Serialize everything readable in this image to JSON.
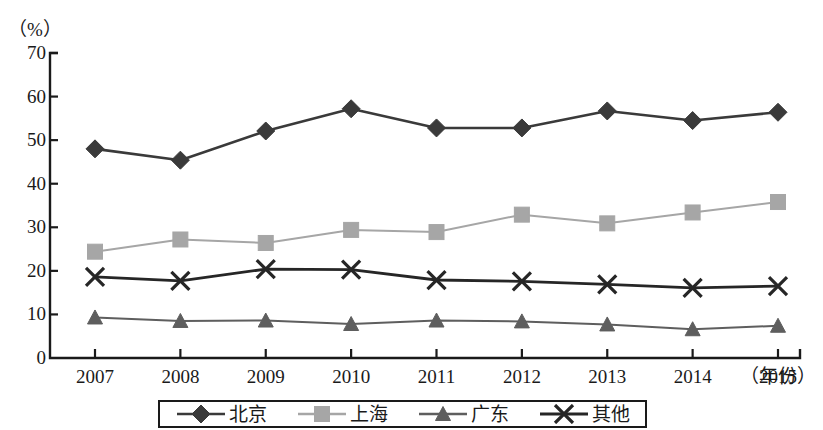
{
  "chart_data": {
    "type": "line",
    "title": "",
    "subtitle": "",
    "xlabel": "（年份）",
    "ylabel": "（%）",
    "ylim": [
      0,
      70
    ],
    "yticks": [
      0,
      10,
      20,
      30,
      40,
      50,
      60,
      70
    ],
    "ytick_labels": [
      "0",
      "10",
      "20",
      "30",
      "40",
      "50",
      "60",
      "70"
    ],
    "grid": false,
    "legend_position": "bottom",
    "categories": [
      "2007",
      "2008",
      "2009",
      "2010",
      "2011",
      "2012",
      "2013",
      "2014",
      "2015"
    ],
    "series": [
      {
        "name": "北京",
        "marker": "diamond",
        "color": "#3a3a3a",
        "values": [
          48.0,
          45.4,
          52.1,
          57.2,
          52.8,
          52.8,
          56.7,
          54.5,
          56.4
        ]
      },
      {
        "name": "上海",
        "marker": "square",
        "color": "#a6a6a6",
        "values": [
          24.4,
          27.2,
          26.4,
          29.4,
          28.9,
          32.9,
          30.9,
          33.4,
          35.8
        ]
      },
      {
        "name": "广东",
        "marker": "triangle",
        "color": "#5e5e5e",
        "values": [
          9.3,
          8.5,
          8.6,
          7.8,
          8.6,
          8.4,
          7.7,
          6.6,
          7.4
        ]
      },
      {
        "name": "其他",
        "marker": "cross",
        "color": "#262626",
        "values": [
          18.6,
          17.7,
          20.4,
          20.3,
          17.9,
          17.6,
          16.9,
          16.1,
          16.5
        ]
      }
    ]
  },
  "axis": {
    "unit_label": "（%）",
    "x_unit_label": "（年份）"
  },
  "legend": {
    "items": [
      {
        "label": "北京"
      },
      {
        "label": "上海"
      },
      {
        "label": "广东"
      },
      {
        "label": "其他"
      }
    ]
  }
}
